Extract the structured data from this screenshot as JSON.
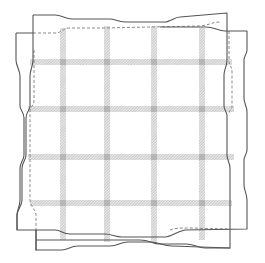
{
  "figure": {
    "type": "woven-fabric-distortion-diagram",
    "colors": {
      "background": "#ffffff",
      "outline": "#555555",
      "dashed_outline": "#8a8a8a",
      "stripe": "#b8b8b8",
      "stripe_crossing": "#9a9a9a"
    },
    "grid": {
      "vertical_stripes_x": [
        63,
        107,
        154,
        202
      ],
      "horizontal_stripes_y": [
        62,
        109,
        157,
        203
      ],
      "stripe_width": 6
    },
    "outline_a": {
      "style": "solid",
      "corners": {
        "top_left": [
          33,
          15
        ],
        "top_right": [
          227,
          13
        ],
        "bottom_right": [
          230,
          248
        ],
        "bottom_left": [
          36,
          250
        ]
      }
    },
    "outline_b": {
      "style": "solid-with-dashed-inner",
      "corners": {
        "top_left": [
          16,
          33
        ],
        "top_right": [
          247,
          31
        ],
        "bottom_right": [
          247,
          229
        ],
        "bottom_left": [
          17,
          230
        ]
      }
    }
  }
}
